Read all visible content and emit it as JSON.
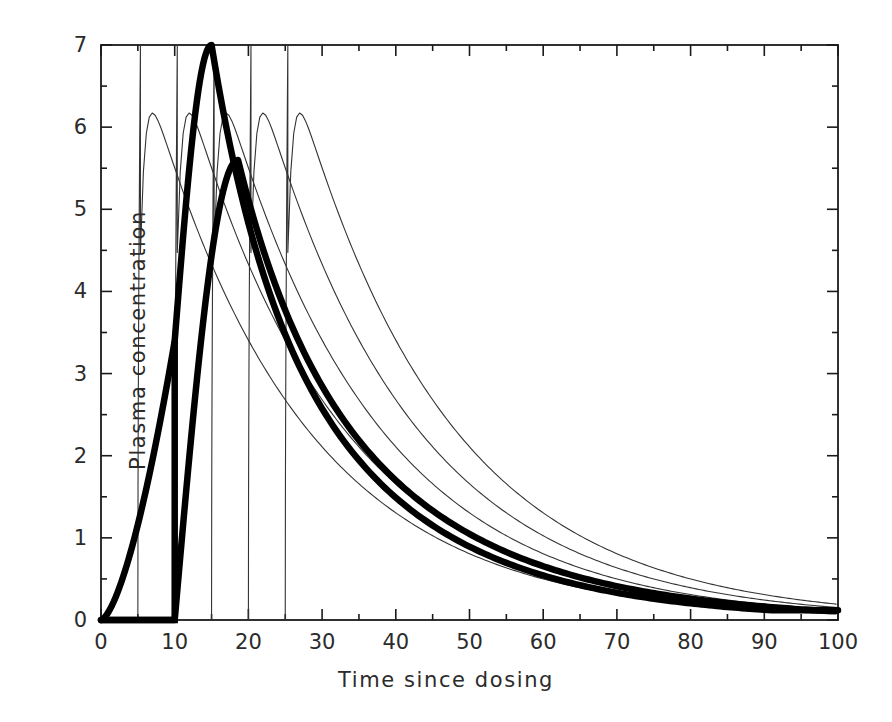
{
  "chart_data": {
    "type": "line",
    "title": "",
    "xlabel": "Time since dosing",
    "ylabel": "Plasma concentration",
    "xlim": [
      0,
      100
    ],
    "ylim": [
      0,
      7
    ],
    "xticks": [
      0,
      10,
      20,
      30,
      40,
      50,
      60,
      70,
      80,
      90,
      100
    ],
    "xtick_labels": [
      "0",
      "10",
      "20",
      "30",
      "40",
      "50",
      "60",
      "70",
      "80",
      "90",
      "100"
    ],
    "x_minor_tick_step": 5,
    "yticks": [
      0,
      1,
      2,
      3,
      4,
      5,
      6,
      7
    ],
    "ytick_labels": [
      "0",
      "1",
      "2",
      "3",
      "4",
      "5",
      "6",
      "7"
    ],
    "y_minor_tick_step": 0.5,
    "grid": false,
    "legend": "none",
    "frame": "box",
    "tick_direction": "in",
    "series": [
      {
        "name": "dose-at-5",
        "style": "thin",
        "color": "#333333",
        "width": 1.1,
        "peak_time": 5,
        "peak_value": 7,
        "ka": 2.2,
        "ke": 0.048,
        "lag": 5,
        "amplitude": 7
      },
      {
        "name": "dose-at-10",
        "style": "thin",
        "color": "#333333",
        "width": 1.1,
        "peak_time": 10,
        "peak_value": 7,
        "ka": 2.2,
        "ke": 0.048,
        "lag": 10,
        "amplitude": 7
      },
      {
        "name": "dose-at-15",
        "style": "thin",
        "color": "#333333",
        "width": 1.1,
        "peak_time": 15,
        "peak_value": 7,
        "ka": 2.2,
        "ke": 0.048,
        "lag": 15,
        "amplitude": 7
      },
      {
        "name": "dose-at-20",
        "style": "thin",
        "color": "#333333",
        "width": 1.1,
        "peak_time": 20,
        "peak_value": 7,
        "ka": 2.2,
        "ke": 0.048,
        "lag": 20,
        "amplitude": 7
      },
      {
        "name": "dose-at-25",
        "style": "thin",
        "color": "#333333",
        "width": 1.1,
        "peak_time": 25,
        "peak_value": 7,
        "ka": 2.2,
        "ke": 0.048,
        "lag": 25,
        "amplitude": 7
      },
      {
        "name": "mean-profile-thick-fast",
        "style": "thick",
        "color": "#000000",
        "width": 6.5,
        "peak_time": 15,
        "peak_value": 7,
        "ka": 0.115,
        "ke": 0.049,
        "lag": 0,
        "amplitude": 7,
        "step_jump_time": 10,
        "step_jump_value": 3.4
      },
      {
        "name": "mean-profile-thick-slow",
        "style": "thick",
        "color": "#000000",
        "width": 6.5,
        "peak_time": 18.6,
        "peak_value": 5.6,
        "ka": 0.095,
        "ke": 0.046,
        "lag": 0,
        "amplitude": 5.6,
        "baseline_flat_to": 10
      }
    ],
    "annotations": []
  },
  "axes": {
    "x_title": "Time since dosing",
    "y_title": "Plasma concentration"
  }
}
